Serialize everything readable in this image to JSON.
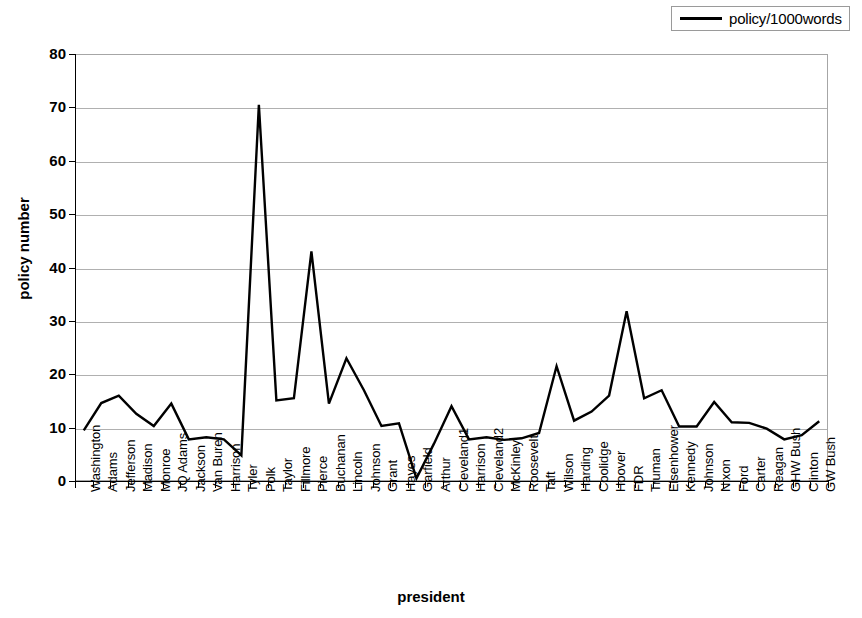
{
  "legend": {
    "position": "top-right",
    "entries": [
      {
        "label": "policy/1000words",
        "color": "#000000",
        "marker": "line"
      }
    ]
  },
  "axes": {
    "y_title": "policy number",
    "x_title": "president"
  },
  "chart_data": {
    "type": "line",
    "title": "",
    "xlabel": "president",
    "ylabel": "policy number",
    "ylim": [
      0,
      80
    ],
    "ytick_step": 10,
    "yticks": [
      0,
      10,
      20,
      30,
      40,
      50,
      60,
      70,
      80
    ],
    "grid": true,
    "legend_position": "top-right",
    "categories": [
      "Washington",
      "Adams",
      "Jefferson",
      "Madison",
      "Monroe",
      "JQ Adams",
      "Jackson",
      "Van Buren",
      "Harrison",
      "Tyler",
      "Polk",
      "Taylor",
      "Fillmore",
      "Pierce",
      "Buchanan",
      "Lincoln",
      "Johnson",
      "Grant",
      "Hayes",
      "Garfield",
      "Arthur",
      "Cleveland1",
      "Harrison",
      "Cleveland2",
      "McKinley",
      "Roosevelt",
      "Taft",
      "Wilson",
      "Harding",
      "Coolidge",
      "Hoover",
      "FDR",
      "Truman",
      "Eisenhower",
      "Kennedy",
      "Johnson",
      "Nixon",
      "Ford",
      "Carter",
      "Reagan",
      "GHW Bush",
      "Clinton",
      "GW Bush"
    ],
    "series": [
      {
        "name": "policy/1000words",
        "color": "#000000",
        "values": [
          9.5,
          14.6,
          16.0,
          12.6,
          10.3,
          14.5,
          7.8,
          8.2,
          7.8,
          4.8,
          70.5,
          15.1,
          15.5,
          43.0,
          14.5,
          23.0,
          17.0,
          10.3,
          10.8,
          0.5,
          7.0,
          14.0,
          7.8,
          8.2,
          7.7,
          8.0,
          9.0,
          21.5,
          11.3,
          13.0,
          16.0,
          31.8,
          15.5,
          17.0,
          10.2,
          10.2,
          14.8,
          11.0,
          10.9,
          9.8,
          7.8,
          8.6,
          11.2
        ]
      }
    ]
  }
}
